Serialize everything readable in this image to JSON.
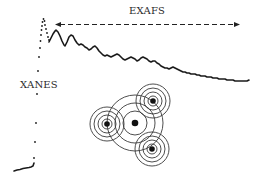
{
  "labels": {
    "exafs": "EXAFS",
    "xanes": "XANES"
  },
  "colors": {
    "ink": "#1a1a1a",
    "ring": "#3a3a3a",
    "background": "#ffffff"
  },
  "exafs_arrow": {
    "x_start": 57,
    "x_end": 240,
    "y": 24,
    "style": "dashed, double-headed"
  },
  "atoms": {
    "absorber": {
      "x": 135,
      "y": 123,
      "ring_radii": [
        12,
        20,
        28
      ]
    },
    "scatterers": [
      {
        "name": "left",
        "x": 107,
        "y": 124,
        "ring_radii": [
          5,
          9,
          13,
          17
        ]
      },
      {
        "name": "top-right",
        "x": 153,
        "y": 101,
        "ring_radii": [
          5,
          9,
          13,
          17
        ]
      },
      {
        "name": "bottom-right",
        "x": 152,
        "y": 149,
        "ring_radii": [
          5,
          9,
          13,
          17
        ]
      }
    ]
  }
}
